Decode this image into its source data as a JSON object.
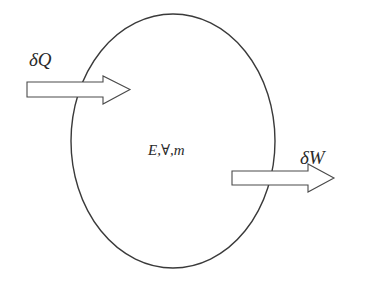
{
  "diagram": {
    "type": "control-volume",
    "boundary": {
      "shape": "ellipse",
      "cx": 173,
      "cy": 141,
      "rx": 102,
      "ry": 127,
      "stroke": "#3a3a3a"
    },
    "center_label": "E,∀,m",
    "heat_arrow": {
      "label": "δQ",
      "direction": "into-system"
    },
    "work_arrow": {
      "label": "δW",
      "direction": "out-of-system"
    },
    "colors": {
      "stroke": "#3a3a3a",
      "arrow_fill": "#ffffff",
      "text": "#2a2a2a"
    }
  }
}
